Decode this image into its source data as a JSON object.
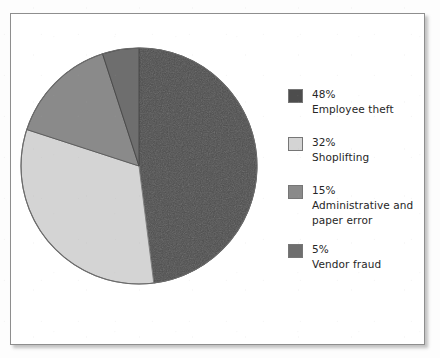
{
  "figure": {
    "background_color": "#ffffff",
    "frame_color": "#8e8e8e"
  },
  "chart_data": {
    "type": "pie",
    "title": "",
    "subtitle": "",
    "xlabel": "",
    "ylabel": "",
    "legend_position": "right",
    "grid": false,
    "start_angle_deg": 0,
    "direction": "clockwise",
    "categories": [
      "Employee theft",
      "Shoplifting",
      "Administrative and paper error",
      "Vendor fraud"
    ],
    "values": [
      48,
      32,
      15,
      5
    ],
    "value_unit": "percent",
    "colors": [
      "#4d4d4d",
      "#d4d4d4",
      "#8a8a8a",
      "#6e6e6e"
    ],
    "slices": [
      {
        "label": "Employee theft",
        "percent_text": "48%",
        "value": 48,
        "color": "#4d4d4d",
        "start_deg": 0,
        "end_deg": 172.8
      },
      {
        "label": "Shoplifting",
        "percent_text": "32%",
        "value": 32,
        "color": "#d4d4d4",
        "start_deg": 172.8,
        "end_deg": 288
      },
      {
        "label": "Administrative and paper error",
        "percent_text": "15%",
        "value": 15,
        "color": "#8a8a8a",
        "start_deg": 288,
        "end_deg": 342
      },
      {
        "label": "Vendor fraud",
        "percent_text": "5%",
        "value": 5,
        "color": "#6e6e6e",
        "start_deg": 342,
        "end_deg": 360
      }
    ]
  },
  "legend": {
    "items": [
      {
        "percent": "48%",
        "label": "Employee theft",
        "label_line_1": "Employee theft",
        "label_line_2": "",
        "color": "#4d4d4d"
      },
      {
        "percent": "32%",
        "label": "Shoplifting",
        "label_line_1": "Shoplifting",
        "label_line_2": "",
        "color": "#d4d4d4"
      },
      {
        "percent": "15%",
        "label": "Administrative and paper error",
        "label_line_1": "Administrative and",
        "label_line_2": "paper error",
        "color": "#8a8a8a"
      },
      {
        "percent": "5%",
        "label": "Vendor fraud",
        "label_line_1": "Vendor fraud",
        "label_line_2": "",
        "color": "#6e6e6e"
      }
    ]
  }
}
